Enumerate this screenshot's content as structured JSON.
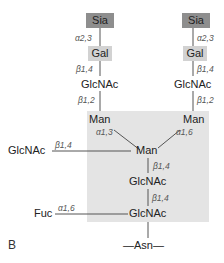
{
  "diagram": {
    "panel_letter": "B",
    "colors": {
      "sia_box": "#8e8e8e",
      "gal_box": "#d2d2d2",
      "core_region": "#e4e4e4",
      "line": "#555555"
    },
    "left_antenna": {
      "sia": "Sia",
      "sia_gal_link": "α2,3",
      "gal": "Gal",
      "gal_glcnac_link": "β1,4",
      "glcnac": "GlcNAc",
      "glcnac_man_link": "β1,2"
    },
    "right_antenna": {
      "sia": "Sia",
      "sia_gal_link": "α2,3",
      "gal": "Gal",
      "gal_glcnac_link": "β1,4",
      "glcnac": "GlcNAc",
      "glcnac_man_link": "β1,2"
    },
    "core": {
      "man_left": "Man",
      "man_left_link": "α1,3",
      "man_right": "Man",
      "man_right_link": "α1,6",
      "man_center": "Man",
      "bisecting_glcnac": "GlcNAc",
      "bisecting_link": "β1,4",
      "man_glcnac_link": "β1,4",
      "glcnac_upper": "GlcNAc",
      "glcnac_glcnac_link": "β1,4",
      "glcnac_lower": "GlcNAc",
      "fuc": "Fuc",
      "fuc_link": "α1,6"
    },
    "anchor": "—Asn—"
  }
}
